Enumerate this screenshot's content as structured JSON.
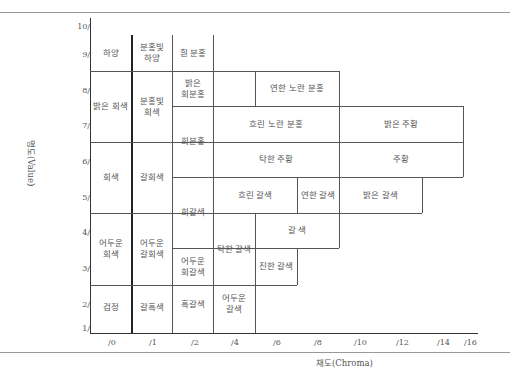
{
  "diagram": {
    "type": "munsell_color_name_chart",
    "y_axis": {
      "label": "명도(Value)",
      "ticks": [
        "10/",
        "9/",
        "8/",
        "7/",
        "6/",
        "5/",
        "4/",
        "3/",
        "2/",
        "1/"
      ]
    },
    "x_axis": {
      "label": "채도(Chroma)",
      "ticks": [
        "/0",
        "/1",
        "/2",
        "/4",
        "/6",
        "/8",
        "/10",
        "/12",
        "/14",
        "/16"
      ]
    },
    "cells": [
      {
        "id": "white",
        "label": "하양"
      },
      {
        "id": "pinkish-white",
        "label": "분홍빛\n하양"
      },
      {
        "id": "white-pink",
        "label": "흰 분홍"
      },
      {
        "id": "light-gray",
        "label": "밝은 회색"
      },
      {
        "id": "pinkish-gray",
        "label": "분홍빛\n회색"
      },
      {
        "id": "light-grayish-pink",
        "label": "밝은\n회분홍"
      },
      {
        "id": "pale-yellowish-pink",
        "label": "연한 노란 분홍"
      },
      {
        "id": "grayish-pink",
        "label": "회분홍"
      },
      {
        "id": "soft-yellowish-pink",
        "label": "흐린 노란 분홍"
      },
      {
        "id": "light-orange",
        "label": "밝은 주황"
      },
      {
        "id": "gray",
        "label": "회색"
      },
      {
        "id": "brownish-gray",
        "label": "갈회색"
      },
      {
        "id": "dull-orange",
        "label": "탁한 주황"
      },
      {
        "id": "orange",
        "label": "주황"
      },
      {
        "id": "grayish-brown",
        "label": "회갈색"
      },
      {
        "id": "soft-brown",
        "label": "흐린 갈색"
      },
      {
        "id": "pale-brown",
        "label": "연한 갈색"
      },
      {
        "id": "light-brown",
        "label": "밝은 갈색"
      },
      {
        "id": "dark-gray",
        "label": "어두운\n회색"
      },
      {
        "id": "dark-brownish-gray",
        "label": "어두운\n갈회색"
      },
      {
        "id": "dull-brown",
        "label": "탁한 갈색"
      },
      {
        "id": "brown",
        "label": "갈 색"
      },
      {
        "id": "dark-grayish-brown",
        "label": "어두운\n회갈색"
      },
      {
        "id": "deep-brown",
        "label": "진한 갈색"
      },
      {
        "id": "black",
        "label": "검정"
      },
      {
        "id": "brownish-black",
        "label": "갈흑색"
      },
      {
        "id": "blackish-brown",
        "label": "흑갈색"
      },
      {
        "id": "dark-brown",
        "label": "어두운\n갈색"
      }
    ],
    "caption": ""
  }
}
